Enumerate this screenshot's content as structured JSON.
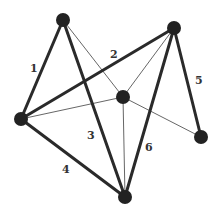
{
  "graph": {
    "nodes": [
      {
        "id": "A",
        "x": 63,
        "y": 20,
        "r": 7
      },
      {
        "id": "B",
        "x": 174,
        "y": 28,
        "r": 7
      },
      {
        "id": "C",
        "x": 123,
        "y": 97,
        "r": 7
      },
      {
        "id": "D",
        "x": 21,
        "y": 119,
        "r": 7
      },
      {
        "id": "E",
        "x": 201,
        "y": 137,
        "r": 7
      },
      {
        "id": "F",
        "x": 125,
        "y": 197,
        "r": 7
      }
    ],
    "edges": [
      {
        "from": "A",
        "to": "D",
        "weight": "thick",
        "label": "1",
        "lx": 34,
        "ly": 71
      },
      {
        "from": "D",
        "to": "B",
        "weight": "thick",
        "label": "2",
        "lx": 114,
        "ly": 57
      },
      {
        "from": "A",
        "to": "F",
        "weight": "thick",
        "label": "3",
        "lx": 91,
        "ly": 138
      },
      {
        "from": "D",
        "to": "F",
        "weight": "thick",
        "label": "4",
        "lx": 66,
        "ly": 173
      },
      {
        "from": "B",
        "to": "E",
        "weight": "thick",
        "label": "5",
        "lx": 199,
        "ly": 83
      },
      {
        "from": "B",
        "to": "F",
        "weight": "thick",
        "label": "6",
        "lx": 149,
        "ly": 150
      },
      {
        "from": "A",
        "to": "C",
        "weight": "thin",
        "label": ""
      },
      {
        "from": "C",
        "to": "E",
        "weight": "thin",
        "label": ""
      },
      {
        "from": "D",
        "to": "C",
        "weight": "thin",
        "label": ""
      },
      {
        "from": "C",
        "to": "B",
        "weight": "thin",
        "label": ""
      },
      {
        "from": "C",
        "to": "F",
        "weight": "thin",
        "label": ""
      }
    ]
  },
  "labels": {
    "e1": "1",
    "e2": "2",
    "e3": "3",
    "e4": "4",
    "e5": "5",
    "e6": "6"
  }
}
